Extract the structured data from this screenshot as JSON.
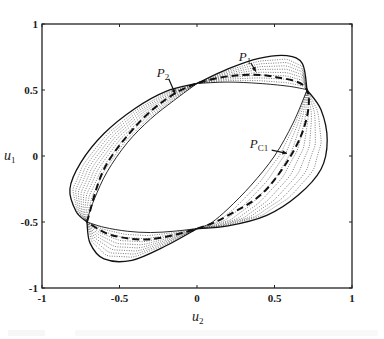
{
  "chart_data": {
    "type": "line",
    "title": "",
    "xlabel": "u2",
    "xlabel_main": "u",
    "xlabel_sub": "2",
    "ylabel": "u1",
    "ylabel_main": "u",
    "ylabel_sub": "1",
    "xlim": [
      -1,
      1
    ],
    "ylim": [
      -1,
      1
    ],
    "grid": false,
    "legend": null,
    "x_ticks": [
      -1,
      -0.5,
      0,
      0.5,
      1
    ],
    "x_tick_labels": [
      "-1",
      "-0.5",
      "0",
      "0.5",
      "1"
    ],
    "y_ticks": [
      1,
      0.5,
      0,
      -0.5,
      -1
    ],
    "y_tick_labels": [
      "1",
      "0.5",
      "0",
      "-0.5",
      "-1"
    ],
    "junction_points": [
      {
        "u2": 0.0,
        "u1": 0.55
      },
      {
        "u2": 0.71,
        "u1": 0.5
      },
      {
        "u2": 0.0,
        "u1": -0.55
      },
      {
        "u2": -0.71,
        "u1": -0.5
      }
    ],
    "series": [
      {
        "name": "outer-bound-upper-left",
        "style": "solid",
        "points": [
          [
            0.0,
            0.55
          ],
          [
            -0.2,
            0.49
          ],
          [
            -0.4,
            0.36
          ],
          [
            -0.6,
            0.17
          ],
          [
            -0.75,
            -0.05
          ],
          [
            -0.82,
            -0.25
          ],
          [
            -0.78,
            -0.42
          ],
          [
            -0.71,
            -0.5
          ]
        ]
      },
      {
        "name": "outer-bound-top",
        "style": "solid",
        "points": [
          [
            0.0,
            0.55
          ],
          [
            0.2,
            0.66
          ],
          [
            0.4,
            0.74
          ],
          [
            0.58,
            0.76
          ],
          [
            0.68,
            0.7
          ],
          [
            0.71,
            0.5
          ]
        ]
      },
      {
        "name": "outer-bound-right",
        "style": "solid",
        "points": [
          [
            0.71,
            0.5
          ],
          [
            0.8,
            0.35
          ],
          [
            0.84,
            0.12
          ],
          [
            0.8,
            -0.1
          ],
          [
            0.65,
            -0.3
          ],
          [
            0.45,
            -0.45
          ],
          [
            0.2,
            -0.53
          ],
          [
            0.0,
            -0.55
          ]
        ]
      },
      {
        "name": "outer-bound-bottom",
        "style": "solid",
        "points": [
          [
            -0.71,
            -0.5
          ],
          [
            -0.69,
            -0.66
          ],
          [
            -0.6,
            -0.78
          ],
          [
            -0.42,
            -0.79
          ],
          [
            -0.2,
            -0.68
          ],
          [
            0.0,
            -0.55
          ]
        ]
      },
      {
        "name": "dashed-center-path",
        "style": "dashed",
        "points": [
          [
            -0.71,
            -0.5
          ],
          [
            -0.6,
            -0.1
          ],
          [
            -0.4,
            0.22
          ],
          [
            -0.2,
            0.43
          ],
          [
            0.0,
            0.55
          ],
          [
            0.25,
            0.61
          ],
          [
            0.5,
            0.6
          ],
          [
            0.71,
            0.5
          ],
          [
            0.67,
            0.15
          ],
          [
            0.45,
            -0.25
          ],
          [
            0.2,
            -0.45
          ],
          [
            0.0,
            -0.55
          ],
          [
            -0.3,
            -0.63
          ],
          [
            -0.55,
            -0.6
          ],
          [
            -0.71,
            -0.5
          ]
        ]
      },
      {
        "name": "inner-bound",
        "style": "solid",
        "points": [
          [
            -0.71,
            -0.5
          ],
          [
            -0.5,
            -0.05
          ],
          [
            -0.3,
            0.3
          ],
          [
            0.0,
            0.55
          ],
          [
            0.35,
            0.54
          ],
          [
            0.71,
            0.5
          ],
          [
            0.55,
            0.0
          ],
          [
            0.3,
            -0.35
          ],
          [
            0.0,
            -0.55
          ],
          [
            -0.4,
            -0.55
          ],
          [
            -0.71,
            -0.5
          ]
        ]
      }
    ],
    "annotations": [
      {
        "label": "P1",
        "main": "P",
        "sub": "1",
        "u2": 0.27,
        "u1": 0.72,
        "arrow_to": [
          0.38,
          0.64
        ]
      },
      {
        "label": "P2",
        "main": "P",
        "sub": "2",
        "u2": -0.26,
        "u1": 0.6,
        "arrow_to": [
          -0.14,
          0.47
        ]
      },
      {
        "label": "PC1",
        "main": "P",
        "sub": "C1",
        "u2": 0.34,
        "u1": 0.06,
        "arrow_to": [
          0.58,
          0.02
        ]
      }
    ]
  },
  "caption": "Figure 3"
}
